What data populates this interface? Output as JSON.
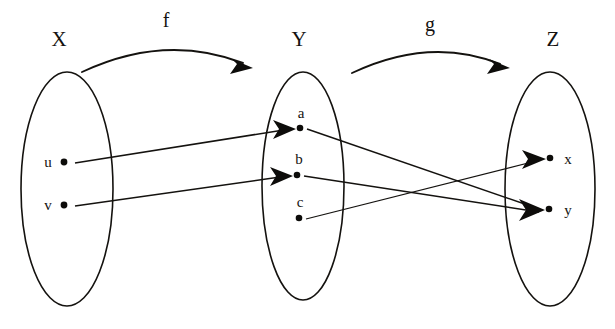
{
  "diagram": {
    "kind": "function-composition-mapping-diagram",
    "background_color": "#ffffff",
    "ink_color": "#14120f",
    "sets": [
      {
        "id": "X",
        "label": "X",
        "label_x": 59,
        "label_y": 46,
        "cx": 67,
        "cy": 189,
        "rx": 46,
        "ry": 117,
        "elements": [
          {
            "name": "u",
            "label": "u",
            "dot_x": 64,
            "dot_y": 162,
            "label_x": 48,
            "label_y": 167
          },
          {
            "name": "v",
            "label": "v",
            "dot_x": 64,
            "dot_y": 205,
            "label_x": 48,
            "label_y": 210
          }
        ]
      },
      {
        "id": "Y",
        "label": "Y",
        "label_x": 299,
        "label_y": 46,
        "cx": 303,
        "cy": 186,
        "rx": 41,
        "ry": 114,
        "elements": [
          {
            "name": "a",
            "label": "a",
            "dot_x": 300,
            "dot_y": 128,
            "label_x": 301,
            "label_y": 118
          },
          {
            "name": "b",
            "label": "b",
            "dot_x": 297,
            "dot_y": 175,
            "label_x": 299,
            "label_y": 164
          },
          {
            "name": "c",
            "label": "c",
            "dot_x": 299,
            "dot_y": 218,
            "label_x": 300,
            "label_y": 207
          }
        ]
      },
      {
        "id": "Z",
        "label": "Z",
        "label_x": 553,
        "label_y": 46,
        "cx": 550,
        "cy": 189,
        "rx": 45,
        "ry": 117,
        "elements": [
          {
            "name": "x",
            "label": "x",
            "dot_x": 550,
            "dot_y": 158,
            "label_x": 568,
            "label_y": 164
          },
          {
            "name": "y",
            "label": "y",
            "dot_x": 549,
            "dot_y": 209,
            "label_x": 568,
            "label_y": 215
          }
        ]
      }
    ],
    "functions": [
      {
        "name": "f",
        "label": "f",
        "label_x": 166,
        "label_y": 27,
        "arc_path": "M 82 72 Q 165 33 243 63",
        "arrow_tip_x": 253,
        "arrow_tip_y": 68,
        "arrow_angle_deg": 26
      },
      {
        "name": "g",
        "label": "g",
        "label_x": 430,
        "label_y": 31,
        "arc_path": "M 352 73 Q 430 36 500 64",
        "arrow_tip_x": 510,
        "arrow_tip_y": 68,
        "arrow_angle_deg": 24
      }
    ],
    "mappings": [
      {
        "name": "u-to-a",
        "function": "f",
        "from": "u",
        "to": "a",
        "x1": 75,
        "y1": 163,
        "x2": 296,
        "y2": 129
      },
      {
        "name": "v-to-b",
        "function": "f",
        "from": "v",
        "to": "b",
        "x1": 75,
        "y1": 206,
        "x2": 293,
        "y2": 176
      },
      {
        "name": "a-to-y",
        "function": "g",
        "from": "a",
        "to": "y",
        "x1": 307,
        "y1": 129,
        "x2": 545,
        "y2": 210
      },
      {
        "name": "b-to-y",
        "function": "g",
        "from": "b",
        "to": "y",
        "x1": 304,
        "y1": 176,
        "x2": 545,
        "y2": 211
      },
      {
        "name": "c-to-x",
        "function": "g",
        "from": "c",
        "to": "x",
        "x1": 306,
        "y1": 219,
        "x2": 546,
        "y2": 159
      }
    ],
    "arrowheads": [
      {
        "name": "arrowhead-into-a",
        "tip_x": 296,
        "tip_y": 129,
        "angle_deg": -9,
        "size": 17
      },
      {
        "name": "arrowhead-into-b",
        "tip_x": 293,
        "tip_y": 176,
        "angle_deg": -8,
        "size": 17
      },
      {
        "name": "arrowhead-into-x",
        "tip_x": 546,
        "tip_y": 159,
        "angle_deg": -14,
        "size": 18
      },
      {
        "name": "arrowhead-into-y-from-a",
        "tip_x": 545,
        "tip_y": 210,
        "angle_deg": 19,
        "size": 19
      },
      {
        "name": "arrowhead-into-y-from-b",
        "tip_x": 545,
        "tip_y": 211,
        "angle_deg": 8,
        "size": 19
      }
    ]
  }
}
